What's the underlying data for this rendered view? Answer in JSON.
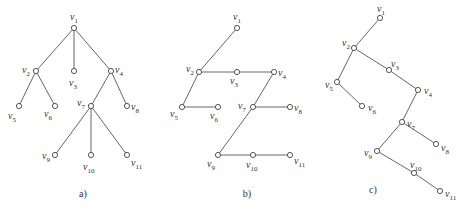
{
  "figure": {
    "caption_partial": "",
    "panels": [
      {
        "label": "a)",
        "label_pos": [
          83,
          197
        ],
        "nodes": [
          {
            "id": "v1",
            "x": 74,
            "y": 28,
            "lx": 70,
            "ly": 20
          },
          {
            "id": "v2",
            "x": 36,
            "y": 71,
            "lx": 22,
            "ly": 73
          },
          {
            "id": "v3",
            "x": 74,
            "y": 71,
            "lx": 69,
            "ly": 86
          },
          {
            "id": "v4",
            "x": 111,
            "y": 71,
            "lx": 115,
            "ly": 73
          },
          {
            "id": "v5",
            "x": 19,
            "y": 106,
            "lx": 8,
            "ly": 119
          },
          {
            "id": "v6",
            "x": 55,
            "y": 106,
            "lx": 44,
            "ly": 117
          },
          {
            "id": "v7",
            "x": 91,
            "y": 106,
            "lx": 77,
            "ly": 106
          },
          {
            "id": "v8",
            "x": 127,
            "y": 106,
            "lx": 131,
            "ly": 110
          },
          {
            "id": "v9",
            "x": 55,
            "y": 155,
            "lx": 42,
            "ly": 159
          },
          {
            "id": "v10",
            "x": 91,
            "y": 155,
            "lx": 83,
            "ly": 170
          },
          {
            "id": "v11",
            "x": 127,
            "y": 155,
            "lx": 131,
            "ly": 166
          }
        ],
        "edges": [
          [
            "v1",
            "v2"
          ],
          [
            "v1",
            "v3"
          ],
          [
            "v1",
            "v4"
          ],
          [
            "v2",
            "v5"
          ],
          [
            "v2",
            "v6"
          ],
          [
            "v4",
            "v7"
          ],
          [
            "v4",
            "v8"
          ],
          [
            "v7",
            "v9"
          ],
          [
            "v7",
            "v10"
          ],
          [
            "v7",
            "v11"
          ]
        ]
      },
      {
        "label": "b)",
        "label_pos": [
          247,
          197
        ],
        "nodes": [
          {
            "id": "v1",
            "x": 237,
            "y": 28,
            "lx": 233,
            "ly": 20
          },
          {
            "id": "v2",
            "x": 199,
            "y": 72,
            "lx": 186,
            "ly": 72
          },
          {
            "id": "v3",
            "x": 237,
            "y": 72,
            "lx": 230,
            "ly": 84
          },
          {
            "id": "v4",
            "x": 274,
            "y": 72,
            "lx": 278,
            "ly": 76
          },
          {
            "id": "v5",
            "x": 182,
            "y": 107,
            "lx": 170,
            "ly": 117
          },
          {
            "id": "v6",
            "x": 218,
            "y": 107,
            "lx": 210,
            "ly": 119
          },
          {
            "id": "v7",
            "x": 253,
            "y": 107,
            "lx": 238,
            "ly": 109
          },
          {
            "id": "v8",
            "x": 290,
            "y": 107,
            "lx": 294,
            "ly": 111
          },
          {
            "id": "v9",
            "x": 218,
            "y": 155,
            "lx": 207,
            "ly": 167
          },
          {
            "id": "v10",
            "x": 253,
            "y": 155,
            "lx": 246,
            "ly": 168
          },
          {
            "id": "v11",
            "x": 290,
            "y": 155,
            "lx": 294,
            "ly": 164
          }
        ],
        "edges": [
          [
            "v1",
            "v2"
          ],
          [
            "v2",
            "v3"
          ],
          [
            "v3",
            "v4"
          ],
          [
            "v2",
            "v5"
          ],
          [
            "v5",
            "v6"
          ],
          [
            "v4",
            "v7"
          ],
          [
            "v7",
            "v8"
          ],
          [
            "v7",
            "v9"
          ],
          [
            "v9",
            "v10"
          ],
          [
            "v10",
            "v11"
          ]
        ]
      },
      {
        "label": "c)",
        "label_pos": [
          373,
          193
        ],
        "nodes": [
          {
            "id": "v1",
            "x": 380,
            "y": 18,
            "lx": 377,
            "ly": 12
          },
          {
            "id": "v2",
            "x": 354,
            "y": 48,
            "lx": 342,
            "ly": 46
          },
          {
            "id": "v3",
            "x": 389,
            "y": 70,
            "lx": 391,
            "ly": 67
          },
          {
            "id": "v4",
            "x": 418,
            "y": 90,
            "lx": 424,
            "ly": 94
          },
          {
            "id": "v5",
            "x": 337,
            "y": 82,
            "lx": 325,
            "ly": 88
          },
          {
            "id": "v6",
            "x": 362,
            "y": 106,
            "lx": 368,
            "ly": 111
          },
          {
            "id": "v7",
            "x": 402,
            "y": 122,
            "lx": 407,
            "ly": 127
          },
          {
            "id": "v8",
            "x": 436,
            "y": 144,
            "lx": 441,
            "ly": 151
          },
          {
            "id": "v9",
            "x": 377,
            "y": 151,
            "lx": 364,
            "ly": 156
          },
          {
            "id": "v10",
            "x": 414,
            "y": 173,
            "lx": 410,
            "ly": 168
          },
          {
            "id": "v11",
            "x": 440,
            "y": 191,
            "lx": 445,
            "ly": 197
          }
        ],
        "edges": [
          [
            "v1",
            "v2"
          ],
          [
            "v2",
            "v3"
          ],
          [
            "v3",
            "v4"
          ],
          [
            "v2",
            "v5"
          ],
          [
            "v5",
            "v6"
          ],
          [
            "v4",
            "v7"
          ],
          [
            "v7",
            "v8"
          ],
          [
            "v7",
            "v9"
          ],
          [
            "v9",
            "v10"
          ],
          [
            "v10",
            "v11"
          ]
        ]
      }
    ]
  }
}
